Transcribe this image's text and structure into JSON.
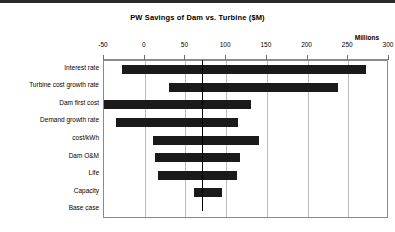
{
  "chart_data": {
    "type": "bar",
    "subtype": "tornado",
    "title": "PW Savings of Dam vs. Turbine  ($M)",
    "units_label": "Millions",
    "xlabel": "",
    "ylabel": "",
    "xlim": [
      -50,
      300
    ],
    "xticks": [
      -50,
      0,
      50,
      100,
      150,
      200,
      250,
      300
    ],
    "xticklabels": [
      "-50",
      "0",
      "50",
      "100",
      "150",
      "200",
      "250",
      "300"
    ],
    "grid": true,
    "legend": false,
    "base_case_value": 70,
    "categories": [
      "Interest rate",
      "Turbine cost growth rate",
      "Dam first cost",
      "Demand growth rate",
      "cost/kWh",
      "Dam O&M",
      "Life",
      "Capacity",
      "Base case"
    ],
    "bars": [
      {
        "label": "Interest rate",
        "low": -28,
        "high": 272
      },
      {
        "label": "Turbine cost growth rate",
        "low": 30,
        "high": 237
      },
      {
        "label": "Dam first cost",
        "low": -50,
        "high": 130
      },
      {
        "label": "Demand growth rate",
        "low": -35,
        "high": 115
      },
      {
        "label": "cost/kWh",
        "low": 10,
        "high": 140
      },
      {
        "label": "Dam O&M",
        "low": 13,
        "high": 117
      },
      {
        "label": "Life",
        "low": 16,
        "high": 113
      },
      {
        "label": "Capacity",
        "low": 61,
        "high": 95
      },
      {
        "label": "Base case",
        "low": 70,
        "high": 70
      }
    ],
    "colors": {
      "bar": "#1a1a1a",
      "grid": "#bdbdbd",
      "axis": "#8a8a8a",
      "baseline": "#000000",
      "background": "#ffffff"
    }
  }
}
